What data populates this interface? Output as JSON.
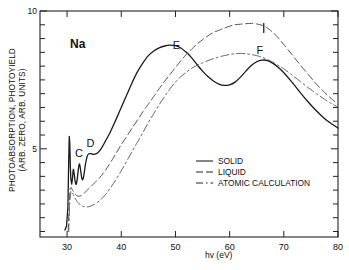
{
  "chart_data": {
    "type": "line",
    "title": "",
    "annotation_sample": "Na",
    "xlabel": "hv (eV)",
    "ylabel_line1": "PHOTOABSORPTION, PHOTOYIELD",
    "ylabel_line2": "(ARB. ZERO, ARB. UNITS)",
    "xlim": [
      25,
      80
    ],
    "ylim": [
      1.8,
      10
    ],
    "xticks": [
      30,
      40,
      50,
      60,
      70,
      80
    ],
    "xticklabels": [
      "30",
      "40",
      "50",
      "60",
      "70",
      "80"
    ],
    "yticks": [
      5,
      10
    ],
    "yticklabels": [
      "5",
      "10"
    ],
    "y_minor_ticks": [
      2,
      2.5,
      3,
      3.5,
      4,
      4.5,
      5.5,
      6,
      6.5,
      7,
      7.5,
      8,
      8.5,
      9,
      9.5
    ],
    "grid": false,
    "legend_position": "center-right",
    "peak_labels": [
      {
        "label": "C",
        "x": 32.2,
        "y": 4.72
      },
      {
        "label": "D",
        "x": 34.3,
        "y": 5.08
      },
      {
        "label": "E",
        "x": 50.2,
        "y": 8.62
      },
      {
        "label": "F",
        "x": 65.6,
        "y": 8.45
      },
      {
        "label": "I",
        "x": 66.3,
        "y": 9.35
      }
    ],
    "series": [
      {
        "name": "SOLID",
        "style": "solid",
        "color": "#1a1a1a",
        "points": [
          [
            29.6,
            2.05
          ],
          [
            29.9,
            2.2
          ],
          [
            30.15,
            2.9
          ],
          [
            30.3,
            4.6
          ],
          [
            30.4,
            5.45
          ],
          [
            30.5,
            5.2
          ],
          [
            30.6,
            4.35
          ],
          [
            30.7,
            3.9
          ],
          [
            30.85,
            3.72
          ],
          [
            31.0,
            3.95
          ],
          [
            31.15,
            4.25
          ],
          [
            31.3,
            4.1
          ],
          [
            31.5,
            3.8
          ],
          [
            31.7,
            3.72
          ],
          [
            31.9,
            3.95
          ],
          [
            32.1,
            4.3
          ],
          [
            32.3,
            4.45
          ],
          [
            32.5,
            4.22
          ],
          [
            32.7,
            3.95
          ],
          [
            32.9,
            3.88
          ],
          [
            33.1,
            4.05
          ],
          [
            33.4,
            4.45
          ],
          [
            33.7,
            4.72
          ],
          [
            34.0,
            4.82
          ],
          [
            34.5,
            4.82
          ],
          [
            35.0,
            4.8
          ],
          [
            35.6,
            4.85
          ],
          [
            36.2,
            4.98
          ],
          [
            37.0,
            5.25
          ],
          [
            38.0,
            5.62
          ],
          [
            39.0,
            6.05
          ],
          [
            40.0,
            6.5
          ],
          [
            41.0,
            6.95
          ],
          [
            42.0,
            7.4
          ],
          [
            43.0,
            7.8
          ],
          [
            44.0,
            8.12
          ],
          [
            45.0,
            8.38
          ],
          [
            46.0,
            8.55
          ],
          [
            47.0,
            8.66
          ],
          [
            48.0,
            8.73
          ],
          [
            49.0,
            8.76
          ],
          [
            50.0,
            8.74
          ],
          [
            51.0,
            8.66
          ],
          [
            52.0,
            8.5
          ],
          [
            53.0,
            8.3
          ],
          [
            54.0,
            8.05
          ],
          [
            55.0,
            7.82
          ],
          [
            56.0,
            7.62
          ],
          [
            57.0,
            7.46
          ],
          [
            58.0,
            7.35
          ],
          [
            59.0,
            7.3
          ],
          [
            60.0,
            7.32
          ],
          [
            61.0,
            7.42
          ],
          [
            62.0,
            7.6
          ],
          [
            63.0,
            7.82
          ],
          [
            64.0,
            8.02
          ],
          [
            65.0,
            8.16
          ],
          [
            66.0,
            8.22
          ],
          [
            67.0,
            8.2
          ],
          [
            68.0,
            8.1
          ],
          [
            69.0,
            7.95
          ],
          [
            70.0,
            7.76
          ],
          [
            71.5,
            7.42
          ],
          [
            73.0,
            7.05
          ],
          [
            74.5,
            6.7
          ],
          [
            76.0,
            6.38
          ],
          [
            77.5,
            6.1
          ],
          [
            79.0,
            5.88
          ],
          [
            80.0,
            5.75
          ]
        ]
      },
      {
        "name": "LIQUID",
        "style": "dashed",
        "color": "#555555",
        "points": [
          [
            30.2,
            2.0
          ],
          [
            30.4,
            3.0
          ],
          [
            30.55,
            3.55
          ],
          [
            30.75,
            3.6
          ],
          [
            31.0,
            3.5
          ],
          [
            31.5,
            3.35
          ],
          [
            32.0,
            3.28
          ],
          [
            32.6,
            3.3
          ],
          [
            33.2,
            3.4
          ],
          [
            34.0,
            3.55
          ],
          [
            35.0,
            3.75
          ],
          [
            36.0,
            3.95
          ],
          [
            37.0,
            4.2
          ],
          [
            38.0,
            4.5
          ],
          [
            39.0,
            4.82
          ],
          [
            40.0,
            5.15
          ],
          [
            41.0,
            5.45
          ],
          [
            42.0,
            5.75
          ],
          [
            43.0,
            6.05
          ],
          [
            44.0,
            6.35
          ],
          [
            45.0,
            6.62
          ],
          [
            46.0,
            6.9
          ],
          [
            47.0,
            7.18
          ],
          [
            48.0,
            7.45
          ],
          [
            49.0,
            7.7
          ],
          [
            50.0,
            7.95
          ],
          [
            51.0,
            8.2
          ],
          [
            52.0,
            8.42
          ],
          [
            53.0,
            8.62
          ],
          [
            54.0,
            8.8
          ],
          [
            55.0,
            8.96
          ],
          [
            56.0,
            9.1
          ],
          [
            57.0,
            9.22
          ],
          [
            58.0,
            9.3
          ],
          [
            59.0,
            9.38
          ],
          [
            60.0,
            9.45
          ],
          [
            61.0,
            9.5
          ],
          [
            62.0,
            9.52
          ],
          [
            63.0,
            9.54
          ],
          [
            64.0,
            9.55
          ],
          [
            65.0,
            9.53
          ],
          [
            66.0,
            9.48
          ],
          [
            67.0,
            9.38
          ],
          [
            68.0,
            9.22
          ],
          [
            69.0,
            9.02
          ],
          [
            70.0,
            8.78
          ],
          [
            71.5,
            8.42
          ],
          [
            73.0,
            8.05
          ],
          [
            74.5,
            7.7
          ],
          [
            76.0,
            7.35
          ],
          [
            77.5,
            7.05
          ],
          [
            79.0,
            6.78
          ],
          [
            80.0,
            6.62
          ]
        ]
      },
      {
        "name": "ATOMIC CALCULATION",
        "style": "dashdot",
        "color": "#666666",
        "points": [
          [
            30.3,
            2.0
          ],
          [
            30.5,
            3.1
          ],
          [
            30.7,
            3.45
          ],
          [
            31.0,
            3.4
          ],
          [
            31.5,
            3.2
          ],
          [
            32.0,
            3.05
          ],
          [
            32.6,
            2.95
          ],
          [
            33.2,
            2.9
          ],
          [
            34.0,
            2.9
          ],
          [
            35.0,
            2.98
          ],
          [
            36.0,
            3.12
          ],
          [
            37.0,
            3.32
          ],
          [
            38.0,
            3.58
          ],
          [
            39.0,
            3.88
          ],
          [
            40.0,
            4.2
          ],
          [
            41.0,
            4.55
          ],
          [
            42.0,
            4.9
          ],
          [
            43.0,
            5.25
          ],
          [
            44.0,
            5.6
          ],
          [
            45.0,
            5.95
          ],
          [
            46.0,
            6.28
          ],
          [
            47.0,
            6.6
          ],
          [
            48.0,
            6.9
          ],
          [
            49.0,
            7.18
          ],
          [
            50.0,
            7.42
          ],
          [
            51.0,
            7.62
          ],
          [
            52.0,
            7.78
          ],
          [
            53.0,
            7.92
          ],
          [
            54.0,
            8.03
          ],
          [
            55.0,
            8.12
          ],
          [
            56.0,
            8.2
          ],
          [
            57.0,
            8.27
          ],
          [
            58.0,
            8.33
          ],
          [
            59.0,
            8.38
          ],
          [
            60.0,
            8.42
          ],
          [
            61.0,
            8.45
          ],
          [
            62.0,
            8.46
          ],
          [
            63.0,
            8.45
          ],
          [
            64.0,
            8.42
          ],
          [
            65.0,
            8.38
          ],
          [
            66.0,
            8.32
          ],
          [
            67.0,
            8.24
          ],
          [
            68.0,
            8.14
          ],
          [
            69.0,
            8.02
          ],
          [
            70.0,
            7.9
          ],
          [
            71.5,
            7.68
          ],
          [
            73.0,
            7.45
          ],
          [
            74.5,
            7.22
          ],
          [
            76.0,
            7.0
          ],
          [
            77.5,
            6.8
          ],
          [
            79.0,
            6.62
          ],
          [
            80.0,
            6.52
          ]
        ]
      }
    ],
    "legend": [
      {
        "label": "SOLID",
        "style": "solid"
      },
      {
        "label": "LIQUID",
        "style": "dashed"
      },
      {
        "label": "ATOMIC CALCULATION",
        "style": "dashdot"
      }
    ]
  }
}
